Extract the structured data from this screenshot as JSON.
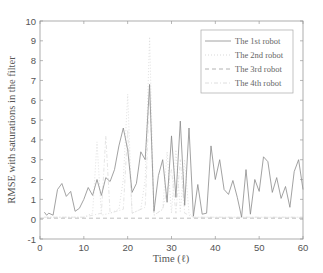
{
  "chart_data": {
    "type": "line",
    "title": "",
    "xlabel": "Time (ℓ)",
    "ylabel": "RMSE with saturations in the filter",
    "xlim": [
      0,
      60
    ],
    "ylim": [
      -1,
      10
    ],
    "xticks": [
      0,
      10,
      20,
      30,
      40,
      50,
      60
    ],
    "yticks": [
      -1,
      0,
      1,
      2,
      3,
      4,
      5,
      6,
      7,
      8,
      9,
      10
    ],
    "grid": false,
    "legend_position": "upper right",
    "series": [
      {
        "name": "The 1st robot",
        "style": "solid",
        "color": "#8a8a8a",
        "x": [
          1,
          1.5,
          2,
          3,
          4,
          5,
          6,
          7,
          8,
          9,
          10,
          11,
          12,
          13,
          14,
          15,
          16,
          17,
          18,
          19,
          20,
          21,
          22,
          23,
          24,
          25,
          26,
          27,
          28,
          29,
          30,
          31,
          32,
          33,
          34,
          35,
          36,
          37,
          38,
          39,
          40,
          41,
          42,
          43,
          44,
          45,
          46,
          47,
          48,
          49,
          50,
          51,
          52,
          53,
          54,
          55,
          56,
          57,
          58,
          59,
          60
        ],
        "values": [
          0.35,
          0.2,
          0.3,
          0.2,
          1.5,
          1.8,
          1.15,
          1.4,
          0.4,
          0.55,
          1.0,
          1.6,
          1.2,
          2.0,
          1.2,
          2.1,
          1.9,
          2.5,
          3.7,
          4.6,
          3.5,
          1.35,
          1.8,
          3.4,
          3.0,
          6.8,
          0.4,
          2.2,
          3.0,
          0.85,
          4.2,
          1.1,
          4.95,
          0.7,
          4.6,
          0.15,
          1.75,
          0.25,
          0.3,
          3.7,
          2.0,
          3.0,
          1.5,
          1.25,
          1.95,
          1.1,
          0.1,
          2.5,
          0.25,
          2.0,
          1.4,
          3.15,
          2.9,
          1.35,
          2.1,
          1.05,
          1.65,
          0.6,
          2.4,
          3.0,
          1.5
        ]
      },
      {
        "name": "The 2nd robot",
        "style": "dotted",
        "color": "#d8d8d8",
        "x": [
          1,
          5,
          10,
          12,
          13,
          14,
          16,
          18,
          19,
          20,
          21,
          23,
          24,
          25,
          26,
          28,
          29,
          30,
          31,
          32,
          33,
          34,
          35,
          40,
          45,
          50,
          55,
          60
        ],
        "values": [
          0.1,
          0.1,
          0.1,
          0.3,
          3.9,
          0.2,
          0.3,
          0.5,
          2.0,
          6.3,
          0.3,
          0.5,
          2.0,
          9.2,
          0.2,
          0.5,
          3.4,
          0.3,
          3.5,
          0.4,
          3.0,
          0.3,
          0.1,
          0.1,
          0.1,
          0.1,
          0.1,
          0.1
        ]
      },
      {
        "name": "The 3rd robot",
        "style": "dashed",
        "color": "#b0b0b0",
        "x": [
          0,
          60
        ],
        "values": [
          0.05,
          0.05
        ]
      },
      {
        "name": "The 4th robot",
        "style": "dashdot",
        "color": "#dedede",
        "x": [
          1,
          5,
          10,
          14,
          15,
          16,
          19,
          20,
          21,
          24,
          25,
          26,
          28,
          30,
          31,
          32,
          33,
          35,
          40,
          50,
          60
        ],
        "values": [
          0.1,
          0.1,
          0.1,
          0.3,
          4.2,
          0.3,
          0.5,
          4.5,
          0.3,
          0.6,
          6.5,
          0.2,
          0.5,
          2.5,
          0.3,
          3.0,
          0.3,
          0.1,
          0.1,
          0.1,
          0.1
        ]
      }
    ]
  },
  "axes": {
    "xlabel": "Time (ℓ)",
    "ylabel": "RMSE with saturations in the filter"
  },
  "legend": {
    "items": [
      {
        "label": "The 1st robot"
      },
      {
        "label": "The 2nd robot"
      },
      {
        "label": "The 3rd robot"
      },
      {
        "label": "The 4th robot"
      }
    ]
  }
}
